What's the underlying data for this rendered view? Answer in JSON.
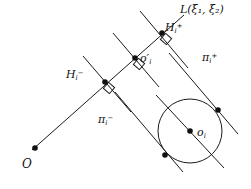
{
  "figure": {
    "type": "geometry-diagram",
    "width": 251,
    "height": 189,
    "background_color": "#ffffff",
    "stroke_color": "#1a1a1a",
    "labels": {
      "line_L": "L(ξ₁, ξ₂)",
      "hyperplane_plus": "H",
      "hyperplane_plus_sub": "i",
      "hyperplane_plus_sup": "+",
      "hyperplane_minus": "H",
      "hyperplane_minus_sub": "i",
      "hyperplane_minus_sup": "−",
      "projection_point": "o′",
      "projection_point_sub": "i",
      "pi_plus": "π",
      "pi_plus_sub": "i",
      "pi_plus_sup": "+",
      "pi_minus": "π",
      "pi_minus_sub": "i",
      "pi_minus_sup": "−",
      "circle_center": "o",
      "circle_center_sub": "i",
      "origin": "O"
    },
    "points": [
      {
        "name": "origin-O",
        "x": 35,
        "y": 148,
        "filled": true
      },
      {
        "name": "hyperplane-minus-pt",
        "x": 105,
        "y": 82,
        "filled": true
      },
      {
        "name": "projection-o-prime",
        "x": 135,
        "y": 58,
        "filled": true
      },
      {
        "name": "hyperplane-plus-pt",
        "x": 162,
        "y": 33,
        "filled": true
      },
      {
        "name": "circle-center-oi",
        "x": 190,
        "y": 131,
        "filled": true
      },
      {
        "name": "tangent-point-upper",
        "x": 218,
        "y": 110,
        "filled": true
      },
      {
        "name": "tangent-point-lower",
        "x": 165,
        "y": 155,
        "filled": true
      }
    ],
    "circle": {
      "cx": 190,
      "cy": 131,
      "r": 32
    },
    "lines": {
      "ray_L": {
        "x1": 32,
        "y1": 150,
        "x2": 182,
        "y2": 17
      },
      "pi_minus": {
        "x1": 83,
        "y1": 56,
        "x2": 129,
        "y2": 110
      },
      "pi_plus": {
        "x1": 140,
        "y1": 12,
        "x2": 186,
        "y2": 66
      },
      "o_prime_perp": {
        "x1": 114,
        "y1": 34,
        "x2": 157,
        "y2": 85
      },
      "tangent_lower": {
        "x1": 142,
        "y1": 126,
        "x2": 196,
        "y2": 183
      },
      "tangent_upper": {
        "x1": 196,
        "y1": 88,
        "x2": 249,
        "y2": 145
      },
      "chord_through_center": {
        "x1": 159,
        "y1": 98,
        "x2": 222,
        "y2": 165
      }
    }
  }
}
